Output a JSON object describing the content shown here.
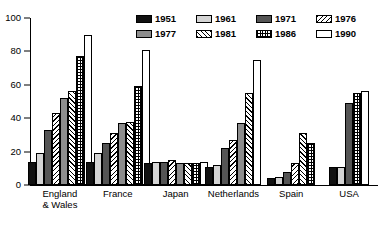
{
  "chart_data": {
    "type": "bar",
    "title": "",
    "subtitle": "",
    "xlabel": "",
    "ylabel": "",
    "ylim": [
      0,
      100
    ],
    "yticks": [
      0,
      20,
      40,
      60,
      80,
      100
    ],
    "grid": false,
    "legend_position": "top-right",
    "categories": [
      "England\n& Wales",
      "France",
      "Japan",
      "Netherlands",
      "Spain",
      "USA"
    ],
    "series": [
      {
        "name": "1951",
        "pattern": "solid-black",
        "values": [
          14,
          14,
          13,
          11,
          4,
          11
        ]
      },
      {
        "name": "1961",
        "pattern": "light-gray",
        "values": [
          19,
          19,
          14,
          12,
          5,
          11
        ]
      },
      {
        "name": "1971",
        "pattern": "dark-gray",
        "values": [
          33,
          25,
          14,
          22,
          8,
          49
        ]
      },
      {
        "name": "1976",
        "pattern": "hatch-left",
        "values": [
          43,
          31,
          15,
          27,
          13,
          null
        ]
      },
      {
        "name": "1977",
        "pattern": "medium-gray",
        "values": [
          52,
          37,
          13,
          37,
          null,
          null
        ]
      },
      {
        "name": "1981",
        "pattern": "hatch-right",
        "values": [
          56,
          38,
          13,
          55,
          31,
          null
        ]
      },
      {
        "name": "1986",
        "pattern": "dotted",
        "values": [
          77,
          59,
          13,
          null,
          25,
          55
        ]
      },
      {
        "name": "1990",
        "pattern": "white",
        "values": [
          90,
          81,
          14,
          75,
          null,
          56
        ]
      }
    ]
  },
  "legend": {
    "items": [
      {
        "label": "1951",
        "pattern": "solid-black"
      },
      {
        "label": "1961",
        "pattern": "light-gray"
      },
      {
        "label": "1971",
        "pattern": "dark-gray"
      },
      {
        "label": "1976",
        "pattern": "hatch-left"
      },
      {
        "label": "1977",
        "pattern": "medium-gray"
      },
      {
        "label": "1981",
        "pattern": "hatch-right"
      },
      {
        "label": "1986",
        "pattern": "dotted"
      },
      {
        "label": "1990",
        "pattern": "white"
      }
    ]
  },
  "colors": {
    "axis": "#000000",
    "solid_black": "#111111",
    "light_gray": "#d4d4d4",
    "dark_gray": "#555555",
    "medium_gray": "#8d8d8d",
    "white": "#ffffff"
  }
}
